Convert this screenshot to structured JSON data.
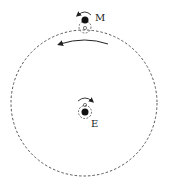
{
  "diagram": {
    "labels": {
      "moon": "M",
      "earth": "E"
    },
    "orbit": {
      "cx": 84,
      "cy": 103,
      "r": 73,
      "style": "dashed"
    },
    "moon": {
      "cx": 85,
      "cy": 20,
      "r": 3.5,
      "small_circle_r": 6,
      "small_circle_cy": 28
    },
    "earth": {
      "cx": 85,
      "cy": 112,
      "r": 3.5,
      "small_circle_r": 6,
      "small_circle_cy": 109
    },
    "orbit_arrow_direction": "counterclockwise",
    "colors": {
      "ink": "#222222",
      "background": "#ffffff"
    }
  }
}
